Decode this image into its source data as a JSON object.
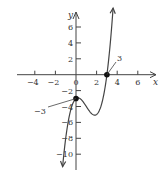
{
  "chart_data": {
    "type": "line",
    "title": "",
    "xlabel": "x",
    "ylabel": "y",
    "xlim": [
      -5,
      7
    ],
    "ylim": [
      -12,
      8
    ],
    "grid": false,
    "x_ticks": [
      -4,
      -2,
      0,
      2,
      4,
      6
    ],
    "x_tick_labels": [
      "−4",
      "−2",
      "0",
      "2",
      "4",
      "6"
    ],
    "y_ticks": [
      6,
      4,
      2,
      -2,
      -4,
      -6,
      -8,
      -10
    ],
    "y_tick_labels": [
      "6",
      "4",
      "2",
      "−2",
      "−4",
      "−6",
      "−8",
      "−10"
    ],
    "series": [
      {
        "name": "f(x) = x^3 - 3x^2 + x - 3",
        "x": [
          -1.3,
          -1.0,
          -0.5,
          0.0,
          0.18,
          0.5,
          1.0,
          1.5,
          1.82,
          2.0,
          2.5,
          3.0,
          3.3,
          3.6
        ],
        "y": [
          -11.6,
          -8.0,
          -4.38,
          -3.0,
          -2.91,
          -3.13,
          -4.0,
          -4.88,
          -5.09,
          -5.0,
          -4.38,
          0.0,
          3.4,
          8.38
        ]
      }
    ],
    "points": [
      {
        "x": 0,
        "y": -3,
        "label": "−3"
      },
      {
        "x": 3,
        "y": 0,
        "label": "3"
      }
    ],
    "color": "#444444"
  }
}
